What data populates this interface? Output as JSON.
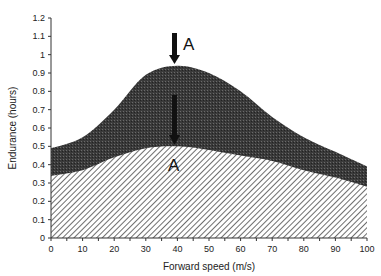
{
  "chart_data": {
    "type": "area",
    "title": "",
    "xlabel": "Forward speed (m/s)",
    "ylabel": "Endurance (hours)",
    "xlim": [
      0,
      100
    ],
    "ylim": [
      0,
      1.2
    ],
    "x_ticks": [
      0,
      10,
      20,
      30,
      40,
      50,
      60,
      70,
      80,
      90,
      100
    ],
    "y_ticks": [
      "0",
      "0.1",
      "0.2",
      "0.3",
      "0.4",
      "0.5",
      "0.6",
      "0.7",
      "0.8",
      "0.9",
      "1",
      "1.1",
      "1.2"
    ],
    "grid": false,
    "legend": null,
    "x": [
      0,
      10,
      20,
      30,
      40,
      50,
      60,
      70,
      80,
      90,
      100
    ],
    "series": [
      {
        "name": "Upper endurance (dark filled region)",
        "fill": "dark-stipple",
        "values": [
          0.49,
          0.55,
          0.7,
          0.89,
          0.94,
          0.9,
          0.8,
          0.66,
          0.55,
          0.47,
          0.39
        ]
      },
      {
        "name": "Lower endurance (hatched region)",
        "fill": "diagonal-hatch",
        "values": [
          0.34,
          0.37,
          0.44,
          0.49,
          0.5,
          0.48,
          0.45,
          0.42,
          0.37,
          0.33,
          0.28
        ]
      }
    ],
    "annotations": [
      {
        "text": "A",
        "x": 39,
        "y": 0.94,
        "type": "arrow-down",
        "target_series": 0
      },
      {
        "text": "A",
        "x": 39,
        "y": 0.5,
        "type": "arrow-down",
        "target_series": 1
      }
    ]
  },
  "labels": {
    "xlabel": "Forward speed (m/s)",
    "ylabel": "Endurance (hours)",
    "annotation_top": "A",
    "annotation_bottom": "A"
  },
  "colors": {
    "dark_fill": "#3a3a3a",
    "hatch_line": "#555555",
    "axis": "#333333"
  }
}
